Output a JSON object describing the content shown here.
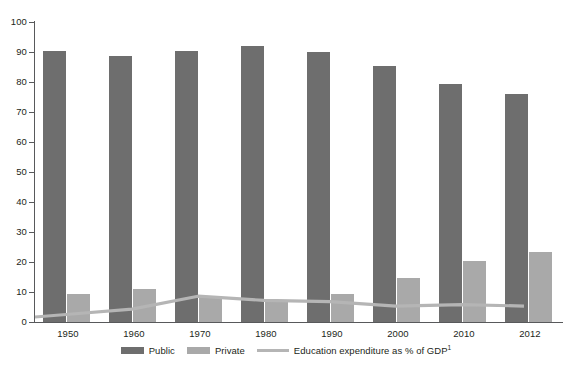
{
  "chart_data": {
    "type": "bar",
    "title": "",
    "subtitle": "",
    "xlabel": "",
    "ylabel": "",
    "categories": [
      "1950",
      "1960",
      "1970",
      "1980",
      "1990",
      "2000",
      "2010",
      "2012"
    ],
    "ylim": [
      0,
      100
    ],
    "yticks": [
      0,
      10,
      20,
      30,
      40,
      50,
      60,
      70,
      80,
      90,
      100
    ],
    "grid": false,
    "legend_position": "bottom",
    "series": [
      {
        "name": "Public",
        "type": "bar",
        "color": "#6e6e6e",
        "values": [
          90.2,
          88.8,
          90.5,
          92.0,
          90.0,
          85.5,
          79.5,
          76.0
        ]
      },
      {
        "name": "Private",
        "type": "bar",
        "color": "#a9a9a9",
        "values": [
          9.5,
          11.0,
          8.8,
          7.5,
          9.4,
          14.6,
          20.2,
          23.4
        ]
      },
      {
        "name": "Education expenditure as % of GDP",
        "name_suffix": "1",
        "type": "line",
        "color": "#b5b5b5",
        "values": [
          2.5,
          4.3,
          8.6,
          7.2,
          6.8,
          5.3,
          5.8,
          null
        ]
      }
    ]
  },
  "axis": {
    "y_tick_labels": [
      "100",
      "90",
      "80",
      "70",
      "60",
      "50",
      "40",
      "30",
      "20",
      "10",
      "0"
    ],
    "x_tick_labels": [
      "1950",
      "1960",
      "1970",
      "1980",
      "1990",
      "2000",
      "2010",
      "2012"
    ]
  },
  "legend": {
    "items": [
      {
        "label": "Public",
        "marker": "swatch-dark"
      },
      {
        "label": "Private",
        "marker": "swatch-light"
      },
      {
        "label": "Education expenditure as % of GDP",
        "suffix": "1",
        "marker": "line-light"
      }
    ]
  }
}
